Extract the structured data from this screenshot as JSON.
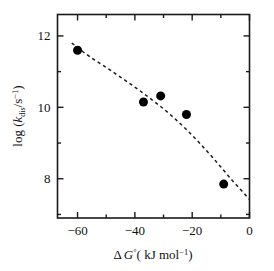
{
  "chart_data": {
    "type": "scatter",
    "title": "",
    "subtitle": "",
    "xlabel": "Δ G°( kJ mol⁻¹)",
    "ylabel": "log (k_dis/s⁻¹)",
    "xlabel_parts": {
      "delta": "Δ",
      "g": "G",
      "g_sup": "°",
      "paren_open": "(",
      "unit": " kJ mol",
      "unit_sup": "−1",
      "paren_close": ")"
    },
    "ylabel_parts": {
      "log": "log (",
      "k": "k",
      "k_sub": "dis",
      "slash_s": "/s",
      "s_sup": "−1",
      "paren_close": ")"
    },
    "xlim": [
      -67,
      0
    ],
    "ylim": [
      6.9,
      12.6
    ],
    "xticks": [
      -60,
      -40,
      -20,
      0
    ],
    "xtick_labels": [
      "−60",
      "−40",
      "−20",
      "0"
    ],
    "x_minor_ticks": [
      -50,
      -30,
      -10
    ],
    "yticks": [
      12,
      10,
      8
    ],
    "ytick_labels": [
      "12",
      "10",
      "8"
    ],
    "y_minor_ticks": [
      11,
      9,
      7
    ],
    "grid": false,
    "legend": "none",
    "frame": "box",
    "tick_direction": "in",
    "marker": {
      "shape": "circle",
      "color": "#000000",
      "size": 9
    },
    "fit_line": {
      "style": "dashed",
      "color": "#1a1a1a",
      "description": "downward-curving dashed trend line"
    },
    "points": [
      {
        "x": -60.0,
        "y": 11.6
      },
      {
        "x": -37.0,
        "y": 10.15
      },
      {
        "x": -31.0,
        "y": 10.32
      },
      {
        "x": -22.0,
        "y": 9.8
      },
      {
        "x": -9.0,
        "y": 7.85
      }
    ],
    "fit_curve": [
      {
        "x": -62.0,
        "y": 11.8
      },
      {
        "x": -58.0,
        "y": 11.55
      },
      {
        "x": -54.0,
        "y": 11.32
      },
      {
        "x": -50.0,
        "y": 11.12
      },
      {
        "x": -46.0,
        "y": 10.9
      },
      {
        "x": -42.0,
        "y": 10.68
      },
      {
        "x": -38.0,
        "y": 10.45
      },
      {
        "x": -34.0,
        "y": 10.21
      },
      {
        "x": -30.0,
        "y": 9.96
      },
      {
        "x": -26.0,
        "y": 9.68
      },
      {
        "x": -22.0,
        "y": 9.38
      },
      {
        "x": -18.0,
        "y": 9.05
      },
      {
        "x": -14.0,
        "y": 8.7
      },
      {
        "x": -10.0,
        "y": 8.33
      },
      {
        "x": -6.0,
        "y": 7.95
      },
      {
        "x": -2.0,
        "y": 7.6
      },
      {
        "x": 0.0,
        "y": 7.42
      }
    ]
  }
}
